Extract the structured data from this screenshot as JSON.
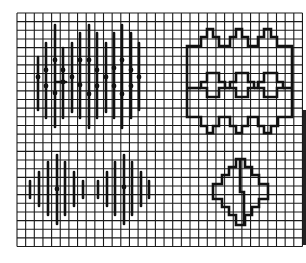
{
  "figure": {
    "grid": {
      "origin_x": 17,
      "origin_y": 13,
      "cell": 8.65,
      "cols": 33,
      "rows": 27,
      "line_color": "#1a1a1a",
      "background": "#ffffff"
    },
    "ink_color": "#111111",
    "patterns": [
      {
        "name": "straight-stitch-block-top-left",
        "type": "vertical-stitches",
        "stitches": [
          {
            "x": 38,
            "y1": 57,
            "y2": 110,
            "dots": [
              77
            ]
          },
          {
            "x": 46,
            "y1": 43,
            "y2": 118,
            "dots": [
              70,
              86
            ]
          },
          {
            "x": 55,
            "y1": 25,
            "y2": 127,
            "dots": [
              60,
              93
            ]
          },
          {
            "x": 63,
            "y1": 48,
            "y2": 118,
            "dots": [
              70,
              82
            ]
          },
          {
            "x": 72,
            "y1": 43,
            "y2": 112,
            "dots": [
              77
            ]
          },
          {
            "x": 80,
            "y1": 33,
            "y2": 118,
            "dots": [
              60,
              85
            ]
          },
          {
            "x": 89,
            "y1": 25,
            "y2": 128,
            "dots": [
              60,
              94
            ]
          },
          {
            "x": 97,
            "y1": 33,
            "y2": 118,
            "dots": [
              70,
              86
            ]
          },
          {
            "x": 106,
            "y1": 43,
            "y2": 112,
            "dots": [
              77
            ]
          },
          {
            "x": 114,
            "y1": 33,
            "y2": 118,
            "dots": [
              68,
              86
            ]
          },
          {
            "x": 122,
            "y1": 25,
            "y2": 128,
            "dots": [
              60,
              94
            ]
          },
          {
            "x": 131,
            "y1": 33,
            "y2": 118,
            "dots": [
              70,
              86
            ]
          },
          {
            "x": 139,
            "y1": 43,
            "y2": 110,
            "dots": [
              77
            ]
          }
        ],
        "bridge": {
          "x1": 55,
          "x2": 66,
          "y": 82
        }
      },
      {
        "name": "outline-band-top-right",
        "type": "stepped-outline",
        "outer_path": "M187,46 H201 V37 H207 V29 H213 V37 H219 V46 H230 V37 H236 V29 H242 V37 H248 V46 H258 V37 H264 V29 H271 V37 H277 V46 H292 V117 H278 V126 H271 V133 H264 V126 H258 V117 H248 V126 H242 V133 H236 V126 H230 V117 H219 V126 H213 V133 H207 V126 H201 V117 H187 Z",
        "inner_motifs": [
          "M201,82 H207 V73 H219 V82 H225 V88 H219 V97 H207 V88 H201 Z",
          "M230,82 H236 V73 H248 V82 H254 V88 H248 V97 H236 V88 H230 Z",
          "M258,82 H264 V73 H277 V82 H283 V88 H277 V97 H264 V88 H258 Z"
        ],
        "connectors": [
          "M187,88 H201",
          "M225,88 H230",
          "M254,88 H258",
          "M283,88 H292"
        ]
      },
      {
        "name": "straight-stitch-diamonds-bottom-left",
        "type": "vertical-stitches",
        "stitches": [
          {
            "x": 30,
            "y1": 181,
            "y2": 198,
            "dots": []
          },
          {
            "x": 39,
            "y1": 172,
            "y2": 206,
            "dots": []
          },
          {
            "x": 48,
            "y1": 162,
            "y2": 215,
            "dots": []
          },
          {
            "x": 57,
            "y1": 155,
            "y2": 224,
            "dots": [
              189
            ]
          },
          {
            "x": 65,
            "y1": 162,
            "y2": 215,
            "dots": []
          },
          {
            "x": 74,
            "y1": 172,
            "y2": 206,
            "dots": []
          },
          {
            "x": 83,
            "y1": 181,
            "y2": 198,
            "dots": []
          },
          {
            "x": 98,
            "y1": 181,
            "y2": 198,
            "dots": []
          },
          {
            "x": 107,
            "y1": 172,
            "y2": 206,
            "dots": []
          },
          {
            "x": 115,
            "y1": 162,
            "y2": 215,
            "dots": []
          },
          {
            "x": 124,
            "y1": 155,
            "y2": 224,
            "dots": [
              187
            ]
          },
          {
            "x": 132,
            "y1": 162,
            "y2": 215,
            "dots": []
          },
          {
            "x": 141,
            "y1": 172,
            "y2": 206,
            "dots": []
          },
          {
            "x": 149,
            "y1": 181,
            "y2": 198,
            "dots": []
          }
        ]
      },
      {
        "name": "outline-diamond-bottom-right",
        "type": "stepped-outline",
        "outer_path": "M236,159 H245 V167 H252 V175 H259 V184 H268 V199 H259 V207 H252 V215 H245 V225 H236 V215 H229 V207 H222 V199 H213 V184 H222 V175 H229 V167 H236 Z",
        "inner_line": "M240,159 V192 H244 V225"
      }
    ]
  }
}
